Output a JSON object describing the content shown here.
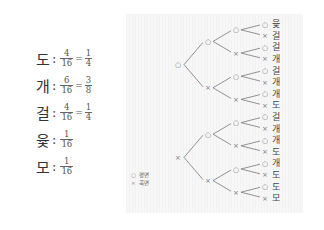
{
  "results": [
    {
      "name": "도",
      "num": "4",
      "den": "16",
      "simp_num": "1",
      "simp_den": "4"
    },
    {
      "name": "개",
      "num": "6",
      "den": "16",
      "simp_num": "3",
      "simp_den": "8"
    },
    {
      "name": "걸",
      "num": "4",
      "den": "16",
      "simp_num": "1",
      "simp_den": "4"
    },
    {
      "name": "윷",
      "num": "1",
      "den": "16"
    },
    {
      "name": "모",
      "num": "1",
      "den": "16"
    }
  ],
  "colon": ":",
  "equals": "=",
  "legend": {
    "items": [
      {
        "symbol": "○",
        "label": "평면"
      },
      {
        "symbol": "×",
        "label": "곡면"
      }
    ]
  },
  "tree": {
    "symbols": {
      "flat": "○",
      "curved": "×"
    },
    "outcomes": [
      "윷",
      "걸",
      "걸",
      "개",
      "걸",
      "개",
      "개",
      "도",
      "걸",
      "개",
      "개",
      "도",
      "개",
      "도",
      "도",
      "모"
    ]
  }
}
